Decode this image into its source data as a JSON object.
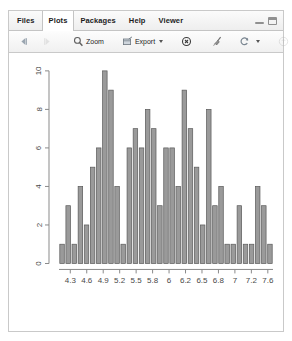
{
  "window": {
    "tabs": [
      {
        "label": "Files",
        "active": false
      },
      {
        "label": "Plots",
        "active": true
      },
      {
        "label": "Packages",
        "active": false
      },
      {
        "label": "Help",
        "active": false
      },
      {
        "label": "Viewer",
        "active": false
      }
    ],
    "controls": [
      {
        "name": "minimize",
        "icon": "minimize-icon"
      },
      {
        "name": "maximize",
        "icon": "maximize-icon"
      }
    ]
  },
  "toolbar": {
    "back_label": "",
    "forward_label": "",
    "zoom_label": "Zoom",
    "export_label": "Export",
    "remove_label": "",
    "clear_all_label": "",
    "refresh_label": "",
    "publish_label": ""
  },
  "chart_data": {
    "type": "bar",
    "title": "",
    "xlabel": "",
    "ylabel": "",
    "xtick_labels": [
      "4.3",
      "4.6",
      "4.9",
      "5.2",
      "5.5",
      "5.8",
      "6",
      "6.2",
      "6.5",
      "6.8",
      "7",
      "7.2",
      "7.6"
    ],
    "ytick_labels": [
      "0",
      "2",
      "4",
      "6",
      "8",
      "10"
    ],
    "ytick_values": [
      0,
      2,
      4,
      6,
      8,
      10
    ],
    "ylim": [
      0,
      10
    ],
    "grid": false,
    "legend": "none",
    "bar_color": "#9a9a9a",
    "bar_edge_color": "#595959",
    "axis_color": "#8a8a8a",
    "categories": [
      "4.3",
      "4.4",
      "4.5",
      "4.6",
      "4.7",
      "4.8",
      "4.9",
      "5.0",
      "5.1",
      "5.2",
      "5.3",
      "5.4",
      "5.5",
      "5.6",
      "5.7",
      "5.8",
      "5.9",
      "6.0",
      "6.1",
      "6.2",
      "6.3",
      "6.4",
      "6.5",
      "6.6",
      "6.7",
      "6.8",
      "6.9",
      "7.0",
      "7.1",
      "7.2",
      "7.3",
      "7.4",
      "7.6",
      "7.7",
      "7.9"
    ],
    "values": [
      1,
      3,
      1,
      4,
      2,
      5,
      6,
      10,
      9,
      4,
      1,
      6,
      7,
      6,
      8,
      7,
      3,
      6,
      6,
      4,
      9,
      7,
      5,
      2,
      8,
      3,
      4,
      1,
      1,
      3,
      1,
      1,
      4,
      3,
      1
    ]
  }
}
